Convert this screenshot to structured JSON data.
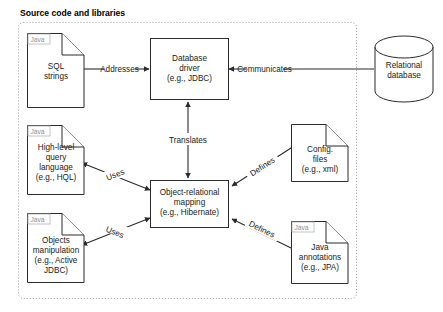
{
  "group": {
    "title": "Source code and libraries",
    "border_color": "#9a9a9a"
  },
  "nodes": {
    "sql_strings": {
      "kind": "document",
      "tag": "Java",
      "lines": [
        "SQL",
        "strings"
      ]
    },
    "database_driver": {
      "kind": "box",
      "lines": [
        "Database",
        "driver",
        "(e.g., JDBC)"
      ]
    },
    "relational_database": {
      "kind": "cylinder",
      "lines": [
        "Relational",
        "database"
      ]
    },
    "hql": {
      "kind": "document",
      "tag": "Java",
      "lines": [
        "High-level",
        "query",
        "language",
        "(e.g., HQL)"
      ]
    },
    "orm": {
      "kind": "box",
      "lines": [
        "Object-relational",
        "mapping",
        "(e.g., Hibernate)"
      ]
    },
    "config_files": {
      "kind": "document",
      "tag": "",
      "lines": [
        "Config.",
        "files",
        "(e.g., xml)"
      ]
    },
    "objects_manipulation": {
      "kind": "document",
      "tag": "Java",
      "lines": [
        "Objects",
        "manipulation",
        "(e.g., Active",
        "JDBC)"
      ]
    },
    "java_annotations": {
      "kind": "document",
      "tag": "Java",
      "lines": [
        "Java",
        "annotations",
        "(e.g., JPA)"
      ]
    }
  },
  "edges": [
    {
      "id": "addresses",
      "label": "Addresses",
      "from": "sql_strings",
      "to": "database_driver",
      "direction": "one-way"
    },
    {
      "id": "communicates",
      "label": "Communicates",
      "from": "relational_database",
      "to": "database_driver",
      "direction": "one-way"
    },
    {
      "id": "translates",
      "label": "Translates",
      "from": "orm",
      "to": "database_driver",
      "direction": "two-way"
    },
    {
      "id": "uses-hql",
      "label": "Uses",
      "from": "orm",
      "to": "hql",
      "direction": "two-way"
    },
    {
      "id": "uses-objects",
      "label": "Uses",
      "from": "orm",
      "to": "objects_manipulation",
      "direction": "two-way"
    },
    {
      "id": "defines-config",
      "label": "Defines",
      "from": "config_files",
      "to": "orm",
      "direction": "one-way"
    },
    {
      "id": "defines-annotations",
      "label": "Defines",
      "from": "java_annotations",
      "to": "orm",
      "direction": "one-way"
    }
  ],
  "colors": {
    "stroke": "#2b2b2b",
    "fill": "#ffffff",
    "tag_text": "#8f8f8f"
  }
}
